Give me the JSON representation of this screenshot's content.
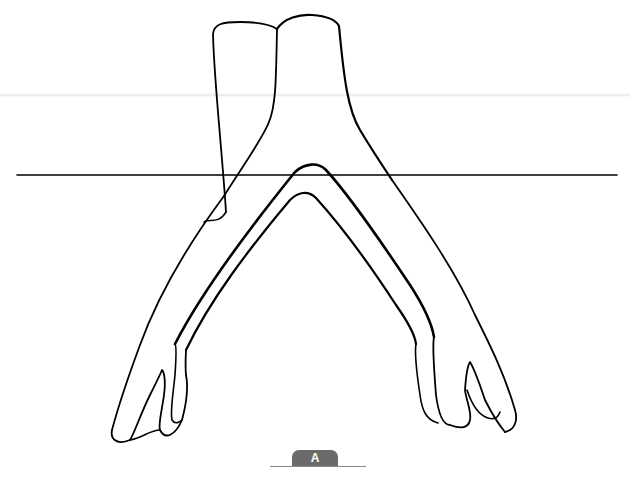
{
  "figure": {
    "label": "A",
    "colors": {
      "stroke": "#000000",
      "background": "#ffffff",
      "label_tab": "#6b6b6b",
      "label_text": "#ffffff"
    },
    "reference_line": {
      "x1": 17,
      "x2": 617,
      "y": 175
    }
  }
}
